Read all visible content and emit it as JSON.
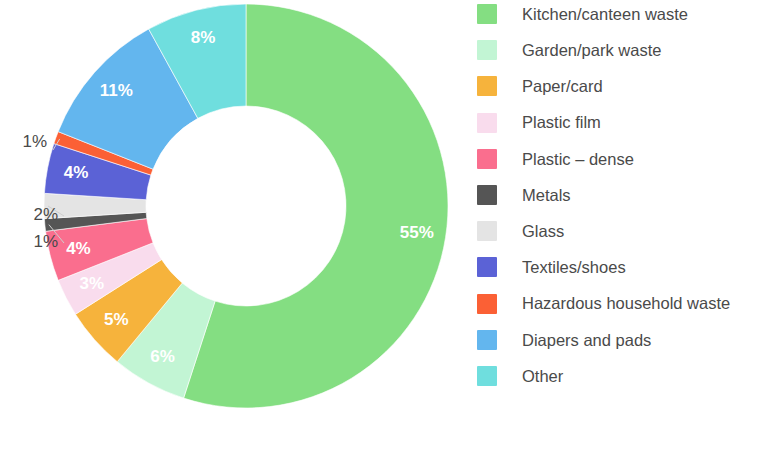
{
  "chart_data": {
    "type": "pie",
    "subtype": "donut",
    "title": "",
    "subtitle": "",
    "xlabel": "",
    "ylabel": "",
    "unit": "%",
    "grid": false,
    "legend_position": "right",
    "start_angle_deg": 0,
    "direction": "clockwise",
    "total": 100,
    "categories": [
      "Kitchen/canteen waste",
      "Garden/park waste",
      "Paper/card",
      "Plastic film",
      "Plastic – dense",
      "Metals",
      "Glass",
      "Textiles/shoes",
      "Hazardous household waste",
      "Diapers and pads",
      "Other"
    ],
    "values": [
      55,
      6,
      5,
      3,
      4,
      1,
      2,
      4,
      1,
      11,
      8
    ],
    "data_labels": [
      "55%",
      "6%",
      "5%",
      "3%",
      "4%",
      "1%",
      "2%",
      "4%",
      "1%",
      "11%",
      "8%"
    ],
    "colors": [
      "#84de82",
      "#c2f5d4",
      "#f6b33c",
      "#f9dced",
      "#fa6e8e",
      "#555555",
      "#e4e4e4",
      "#5b62d6",
      "#fb6035",
      "#63b6ee",
      "#6fdede"
    ],
    "label_placement": [
      "inside",
      "inside",
      "inside",
      "inside",
      "inside",
      "outside",
      "outside",
      "inside",
      "outside",
      "inside",
      "inside"
    ],
    "label_color_inside": "#ffffff",
    "label_color_outside": "#4a4a4a"
  },
  "legend": {
    "items": [
      {
        "label": "Kitchen/canteen waste",
        "color": "#84de82"
      },
      {
        "label": "Garden/park waste",
        "color": "#c2f5d4"
      },
      {
        "label": "Paper/card",
        "color": "#f6b33c"
      },
      {
        "label": "Plastic film",
        "color": "#f9dced"
      },
      {
        "label": "Plastic – dense",
        "color": "#fa6e8e"
      },
      {
        "label": "Metals",
        "color": "#555555"
      },
      {
        "label": "Glass",
        "color": "#e4e4e4"
      },
      {
        "label": "Textiles/shoes",
        "color": "#5b62d6"
      },
      {
        "label": "Hazardous household waste",
        "color": "#fb6035"
      },
      {
        "label": "Diapers and pads",
        "color": "#63b6ee"
      },
      {
        "label": "Other",
        "color": "#6fdede"
      }
    ]
  }
}
